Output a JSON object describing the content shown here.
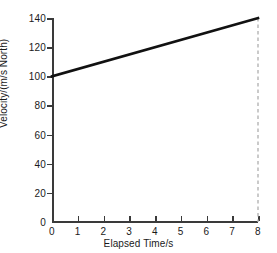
{
  "chart_data": {
    "type": "line",
    "title": "",
    "xlabel": "Elapsed Time/s",
    "ylabel": "Velocity/(m/s North)",
    "x": [
      0,
      8
    ],
    "values": [
      100,
      140
    ],
    "series": [
      {
        "name": "velocity",
        "x": [
          0,
          8
        ],
        "values": [
          100,
          140
        ],
        "color": "#111111"
      }
    ],
    "xlim": [
      0,
      8
    ],
    "ylim": [
      0,
      140
    ],
    "xticks": [
      0,
      1,
      2,
      3,
      4,
      5,
      6,
      7,
      8
    ],
    "xtick_labels": [
      "0",
      "1",
      "2",
      "3",
      "4",
      "5",
      "6",
      "7",
      "8"
    ],
    "yticks": [
      0,
      20,
      40,
      60,
      80,
      100,
      120,
      140
    ],
    "ytick_labels": [
      "0",
      "20",
      "40",
      "60",
      "80",
      "100",
      "120",
      "140"
    ],
    "grid": false,
    "legend": null,
    "annotations": [
      {
        "name": "dropline-at-8",
        "type": "vertical-dashed-line",
        "x": 8,
        "y_from": 0,
        "y_to": 140,
        "color": "#b4b4b4"
      }
    ],
    "axis_color": "#3a3a3a",
    "background": "#ffffff"
  }
}
